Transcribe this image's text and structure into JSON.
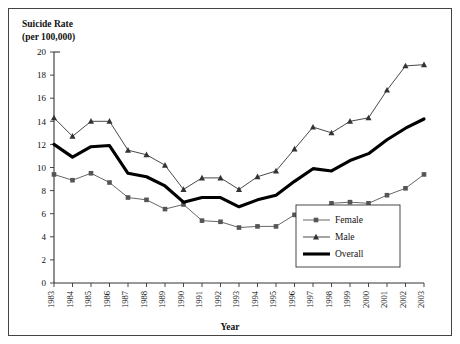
{
  "figure": {
    "ylabel_line1": "Suicide Rate",
    "ylabel_line2": "(per 100,000)",
    "xlabel": "Year"
  },
  "legend": {
    "position": "bottom-right",
    "entries": [
      {
        "label": "Female",
        "marker": "square",
        "style": "thin-line-with-marker",
        "color": "#555555"
      },
      {
        "label": "Male",
        "marker": "triangle",
        "style": "thin-line-with-marker",
        "color": "#333333"
      },
      {
        "label": "Overall",
        "marker": "none",
        "style": "thick-line",
        "color": "#000000"
      }
    ]
  },
  "chart_data": {
    "type": "line",
    "title": "",
    "xlabel": "Year",
    "ylabel": "Suicide Rate (per 100,000)",
    "xlim": [
      1983,
      2003
    ],
    "ylim": [
      0,
      20
    ],
    "ytick_step": 2,
    "yticks": [
      0,
      2,
      4,
      6,
      8,
      10,
      12,
      14,
      16,
      18,
      20
    ],
    "grid": false,
    "legend_position": "bottom-right",
    "categories": [
      "1983",
      "1984",
      "1985",
      "1986",
      "1987",
      "1988",
      "1989",
      "1990",
      "1991",
      "1992",
      "1993",
      "1994",
      "1995",
      "1996",
      "1997",
      "1998",
      "1999",
      "2000",
      "2001",
      "2002",
      "2003"
    ],
    "series": [
      {
        "name": "Female",
        "marker": "square",
        "color": "#555555",
        "values": [
          9.4,
          8.9,
          9.5,
          8.7,
          7.4,
          7.2,
          6.4,
          6.8,
          5.4,
          5.3,
          4.8,
          4.9,
          4.9,
          5.9,
          5.9,
          6.9,
          7.0,
          6.9,
          7.6,
          8.2,
          9.4
        ]
      },
      {
        "name": "Male",
        "marker": "triangle",
        "color": "#333333",
        "values": [
          14.3,
          12.7,
          14.0,
          14.0,
          11.5,
          11.1,
          10.2,
          8.1,
          9.1,
          9.1,
          8.1,
          9.2,
          9.7,
          11.6,
          13.5,
          13.0,
          14.0,
          14.3,
          16.7,
          18.8,
          18.9
        ]
      },
      {
        "name": "Overall",
        "marker": "none",
        "color": "#000000",
        "values": [
          12.0,
          10.9,
          11.8,
          11.9,
          9.5,
          9.2,
          8.4,
          7.0,
          7.4,
          7.4,
          6.6,
          7.2,
          7.6,
          8.8,
          9.9,
          9.7,
          10.6,
          11.2,
          12.4,
          13.4,
          14.2
        ]
      }
    ]
  }
}
